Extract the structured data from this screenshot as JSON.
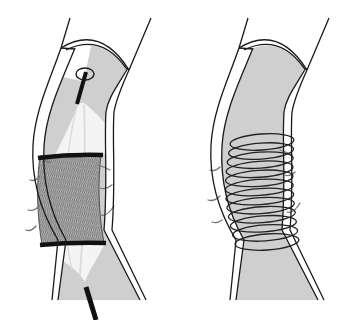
{
  "figure": {
    "title": "",
    "panels": [
      {
        "id": "left",
        "label": "Balloon-expandable mesh stent on catheter",
        "components": [
          "vessel-wall",
          "vessel-lumen",
          "guide-catheter",
          "balloon",
          "mesh-stent",
          "stent-marker-bands",
          "tissue-flaps"
        ],
        "marker_bands": 2,
        "tissue_flaps": 7
      },
      {
        "id": "right",
        "label": "Deployed coil stent",
        "components": [
          "vessel-wall",
          "vessel-lumen",
          "coil-stent",
          "tissue-flaps"
        ],
        "coil_turns": 12,
        "tissue_flaps": 6
      }
    ]
  },
  "colors": {
    "background": "#ffffff",
    "outline": "#1a1a1a",
    "lumen": "#cfcfcf",
    "wall": "#ffffff",
    "balloon": "#f4f4f4",
    "balloon_streak": "#dcdcdc",
    "mesh_fill": "#bdbdbd",
    "mesh_line": "#3a3a3a",
    "marker_band": "#111111",
    "catheter": "#111111",
    "coil": "#222222",
    "flap": "#777777"
  }
}
